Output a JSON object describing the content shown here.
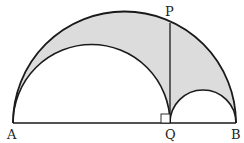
{
  "diagram": {
    "type": "arbelos",
    "points": {
      "A": {
        "label": "A",
        "x": 13,
        "y": 123
      },
      "Q": {
        "label": "Q",
        "x": 170,
        "y": 123
      },
      "B": {
        "label": "B",
        "x": 236,
        "y": 123
      },
      "P": {
        "label": "P",
        "x": 170,
        "y": 21
      }
    },
    "segments": [
      "AB",
      "PQ"
    ],
    "arcs": [
      "semicircle AB",
      "semicircle AQ",
      "semicircle QB"
    ],
    "right_angle_at": "Q",
    "shaded_region": "area between semicircle AB and semicircles AQ, QB",
    "colors": {
      "shade": "#dcdcdc",
      "stroke": "#1a1a1a"
    }
  }
}
